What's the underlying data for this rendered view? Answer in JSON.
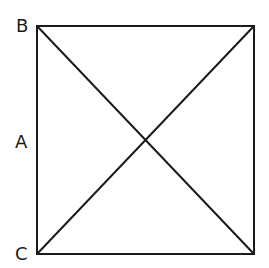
{
  "diagram": {
    "labels": {
      "top_left": "B",
      "middle_left": "A",
      "bottom_left": "C"
    },
    "square": {
      "x1": 37,
      "y1": 26,
      "x2": 254,
      "y2": 254
    },
    "stroke_color": "#1a1a1a",
    "background": "#ffffff"
  }
}
